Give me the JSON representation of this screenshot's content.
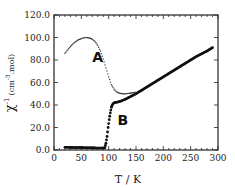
{
  "chart_data": {
    "type": "scatter",
    "title": "",
    "xlabel": "T / K",
    "ylabel": "χ-1 (cm-3.mol)",
    "ylabel_main": "χ",
    "ylabel_sup": "-1",
    "ylabel_units": "(cm",
    "ylabel_units_sup": "-3",
    "ylabel_units_end": ".mol)",
    "xlim": [
      0,
      300
    ],
    "ylim": [
      0,
      120
    ],
    "grid": false,
    "xticks": [
      "0",
      "50",
      "100",
      "150",
      "200",
      "250",
      "300"
    ],
    "yticks": [
      "0.0",
      "20.0",
      "40.0",
      "60.0",
      "80.0",
      "100.0",
      "120.0"
    ],
    "annotations": [
      {
        "text": "A",
        "x": 80,
        "y": 78
      },
      {
        "text": "B",
        "x": 126,
        "y": 22
      }
    ],
    "series": [
      {
        "name": "A",
        "style": "small-dots",
        "x": [
          20,
          25,
          30,
          35,
          40,
          45,
          50,
          55,
          60,
          65,
          70,
          75,
          80,
          85,
          90,
          95,
          100,
          105,
          110,
          115,
          120,
          125,
          130,
          135,
          140,
          145,
          150
        ],
        "y": [
          86,
          89,
          92,
          94.5,
          96.5,
          98,
          99,
          99.8,
          100,
          99.5,
          98.5,
          96.5,
          93,
          88,
          81,
          73,
          65,
          58,
          54,
          51.5,
          50.5,
          50,
          50,
          50.2,
          50.5,
          51,
          51.5
        ]
      },
      {
        "name": "B",
        "style": "filled-dots",
        "x": [
          20,
          30,
          40,
          50,
          60,
          70,
          80,
          90,
          93,
          95,
          97,
          99,
          101,
          103,
          105,
          107,
          110,
          115,
          120,
          130,
          140,
          150,
          160,
          170,
          180,
          190,
          200,
          210,
          220,
          230,
          240,
          250,
          260,
          270,
          280,
          290
        ],
        "y": [
          2.5,
          2.3,
          2.2,
          2.1,
          2.0,
          1.9,
          1.8,
          1.7,
          2.0,
          6,
          12,
          20,
          27,
          33,
          38,
          40.5,
          42,
          42.5,
          43,
          45,
          47.5,
          50,
          53,
          56,
          59,
          62,
          65,
          68,
          71,
          74,
          77,
          80,
          83,
          85.5,
          88,
          91
        ]
      }
    ]
  }
}
